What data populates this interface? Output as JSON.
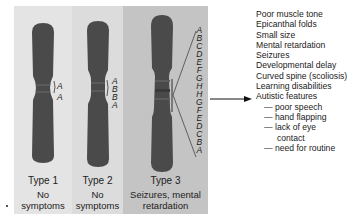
{
  "figure": {
    "types": [
      {
        "label": "Type 1",
        "phenotype_line1": "No",
        "phenotype_line2": "symptoms",
        "segment_labels": [
          "A",
          "A"
        ]
      },
      {
        "label": "Type 2",
        "phenotype_line1": "No",
        "phenotype_line2": "symptoms",
        "segment_labels": [
          "A",
          "B",
          "B",
          "A"
        ]
      },
      {
        "label": "Type 3",
        "phenotype_line1": "Seizures, mental",
        "phenotype_line2": "retardation",
        "segment_labels": [
          "A",
          "B",
          "C",
          "D",
          "E",
          "F",
          "G",
          "H",
          "H",
          "G",
          "F",
          "E",
          "D",
          "C",
          "B",
          "A"
        ]
      }
    ],
    "symptoms": {
      "items": [
        "Poor muscle tone",
        "Epicanthal folds",
        "Small size",
        "Mental retardation",
        "Seizures",
        "Developmental delay",
        "Curved spine (scoliosis)",
        "Learning disabilities",
        "Autistic features"
      ],
      "autistic_subitems": [
        "— poor speech",
        "— hand flapping",
        "— lack of eye",
        "contact",
        "— need for routine"
      ]
    },
    "colors": {
      "chromosome": "#4a4a4a",
      "panel1": "#e4e4e4",
      "panel2": "#dcdcdc",
      "panel3": "#c4c4c4"
    }
  }
}
